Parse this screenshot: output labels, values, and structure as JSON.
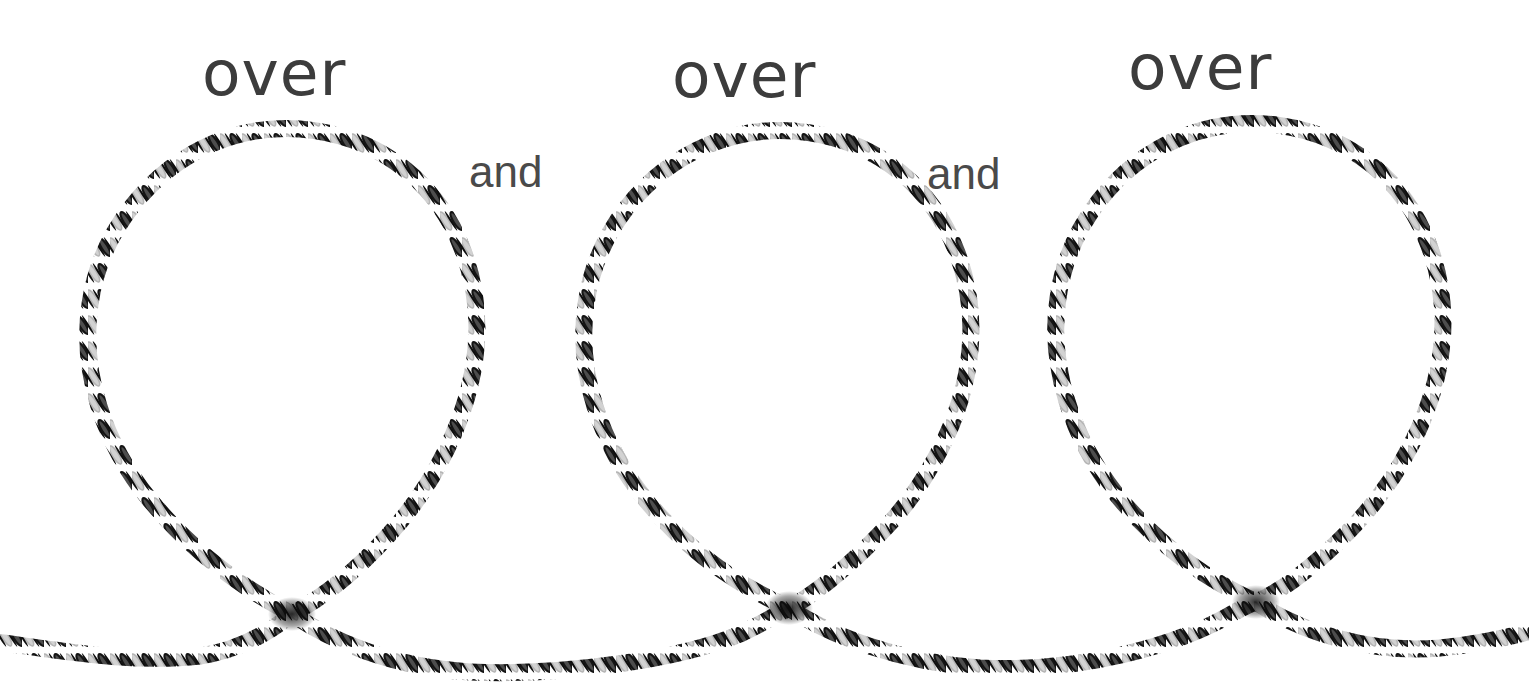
{
  "canvas": {
    "width": 1529,
    "height": 694,
    "background_color": "#ffffff"
  },
  "illustration": {
    "name": "rope-loops-diagram",
    "description": "Hand-drawn twisted rope forming three successive loops along a horizontal line",
    "rope": {
      "thickness_px": 17,
      "strand_dark_color": "#1a1a1a",
      "strand_light_color": "#b9b9b9",
      "strand_mid_color": "#6e6e6e",
      "twist_period_px": 22
    },
    "loops": [
      {
        "name": "loop-1",
        "cross_x": 292,
        "cross_y": 614,
        "top_y": 132,
        "left_x": 86,
        "right_x": 476,
        "center_x": 281
      },
      {
        "name": "loop-2",
        "cross_x": 789,
        "cross_y": 608,
        "top_y": 133,
        "left_x": 566,
        "right_x": 957,
        "center_x": 762
      },
      {
        "name": "loop-3",
        "cross_x": 1256,
        "cross_y": 602,
        "top_y": 126,
        "left_x": 1036,
        "right_x": 1416,
        "center_x": 1226
      }
    ],
    "baseline": {
      "name": "horizontal-rope",
      "left_edge_y": 640,
      "right_edge_y": 630,
      "sag_depth_px": 30
    }
  },
  "labels": {
    "over": [
      {
        "text": "over",
        "x": 202,
        "y": 42
      },
      {
        "text": "over",
        "x": 672,
        "y": 44
      },
      {
        "text": "over",
        "x": 1128,
        "y": 36
      }
    ],
    "and": [
      {
        "text": "and",
        "x": 469,
        "y": 150
      },
      {
        "text": "and",
        "x": 927,
        "y": 152
      }
    ]
  },
  "colors": {
    "text": "#3c3c3c",
    "text_secondary": "#4a4a4a",
    "background": "#ffffff",
    "rope_dark": "#1a1a1a",
    "rope_light": "#b9b9b9"
  }
}
